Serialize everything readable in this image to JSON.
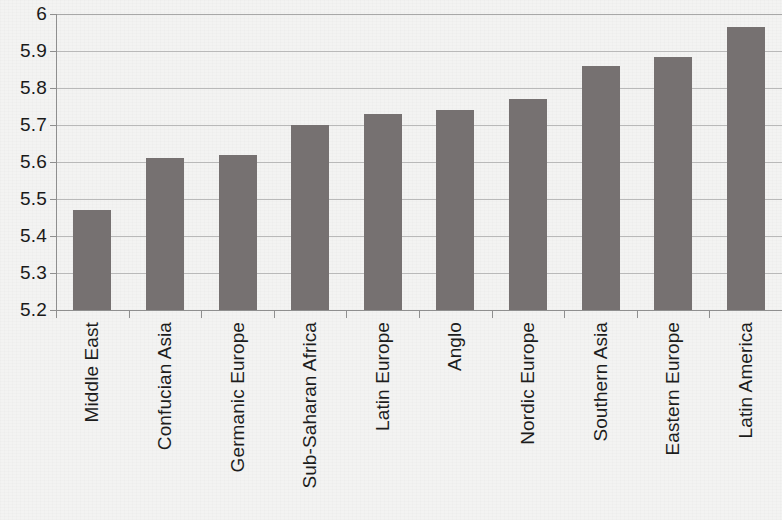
{
  "chart_data": {
    "type": "bar",
    "title": "",
    "subtitle": "",
    "xlabel": "",
    "ylabel": "",
    "categories": [
      "Middle East",
      "Confucian Asia",
      "Germanic Europe",
      "Sub-Saharan Africa",
      "Latin Europe",
      "Anglo",
      "Nordic Europe",
      "Southern Asia",
      "Eastern Europe",
      "Latin America"
    ],
    "values": [
      5.47,
      5.61,
      5.62,
      5.7,
      5.73,
      5.74,
      5.77,
      5.86,
      5.885,
      5.965
    ],
    "ylim": [
      5.2,
      6.0
    ],
    "ytick_values": [
      6,
      5.9,
      5.8,
      5.7,
      5.6,
      5.5,
      5.4,
      5.3,
      5.2
    ],
    "ytick_labels": [
      "6",
      "5.9",
      "5.8",
      "5.7",
      "5.6",
      "5.5",
      "5.4",
      "5.3",
      "5.2"
    ],
    "ystep": 0.1,
    "grid": true,
    "grid_axis": "y",
    "legend": false,
    "legend_position": "none",
    "bar_color": "#767171",
    "gridline_color": "#b9b9b9",
    "axis_color": "#8f8f8f",
    "background_color": "#f3f3f2",
    "label_rotation": -90,
    "data_labels": false
  }
}
